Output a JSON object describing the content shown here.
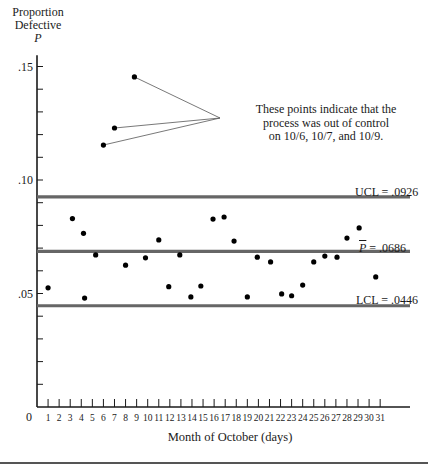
{
  "chart_data": {
    "type": "scatter",
    "title": "",
    "ylabel_lines": [
      "Proportion",
      "Defective"
    ],
    "ylabel_symbol": "P",
    "xlabel": "Month of October (days)",
    "ylim": [
      0,
      0.16
    ],
    "xlim": [
      0,
      33
    ],
    "y_ticks": [
      {
        "value": 0.15,
        "label": ".15"
      },
      {
        "value": 0.1,
        "label": ".10"
      },
      {
        "value": 0.05,
        "label": ".05"
      }
    ],
    "y_minor_step": 0.01,
    "x_origin_label": "0",
    "x_ticks": [
      1,
      2,
      3,
      4,
      5,
      6,
      7,
      8,
      9,
      10,
      11,
      12,
      13,
      14,
      15,
      16,
      17,
      18,
      19,
      20,
      21,
      22,
      23,
      24,
      25,
      26,
      27,
      28,
      29,
      30,
      31
    ],
    "grid": false,
    "control_lines": [
      {
        "name": "UCL",
        "label": "UCL = .0926",
        "value": 0.0926
      },
      {
        "name": "Pbar",
        "label_symbol": "P",
        "label_rest": " = .0686",
        "value": 0.0686
      },
      {
        "name": "LCL",
        "label": "LCL = .0446",
        "value": 0.0446
      }
    ],
    "points": [
      {
        "x": 1.0,
        "y": 0.0525
      },
      {
        "x": 3.2,
        "y": 0.083
      },
      {
        "x": 4.2,
        "y": 0.0765
      },
      {
        "x": 4.3,
        "y": 0.048
      },
      {
        "x": 5.3,
        "y": 0.067
      },
      {
        "x": 6.0,
        "y": 0.1154
      },
      {
        "x": 7.0,
        "y": 0.1229
      },
      {
        "x": 8.0,
        "y": 0.0625
      },
      {
        "x": 8.8,
        "y": 0.1454
      },
      {
        "x": 9.8,
        "y": 0.0657
      },
      {
        "x": 11.0,
        "y": 0.0736
      },
      {
        "x": 11.9,
        "y": 0.053
      },
      {
        "x": 12.9,
        "y": 0.067
      },
      {
        "x": 13.9,
        "y": 0.0485
      },
      {
        "x": 14.8,
        "y": 0.0533
      },
      {
        "x": 15.9,
        "y": 0.0828
      },
      {
        "x": 16.9,
        "y": 0.0837
      },
      {
        "x": 17.8,
        "y": 0.0731
      },
      {
        "x": 19.0,
        "y": 0.0485
      },
      {
        "x": 19.9,
        "y": 0.066
      },
      {
        "x": 21.1,
        "y": 0.0639
      },
      {
        "x": 22.1,
        "y": 0.0498
      },
      {
        "x": 23.0,
        "y": 0.049
      },
      {
        "x": 24.0,
        "y": 0.0537
      },
      {
        "x": 25.0,
        "y": 0.0639
      },
      {
        "x": 26.0,
        "y": 0.0665
      },
      {
        "x": 27.1,
        "y": 0.066
      },
      {
        "x": 28.0,
        "y": 0.0744
      },
      {
        "x": 29.1,
        "y": 0.0789
      },
      {
        "x": 30.6,
        "y": 0.0573
      }
    ],
    "annotation": {
      "lines": [
        "These points indicate that the",
        "process was out of control",
        "on 10/6, 10/7, and 10/9."
      ],
      "targets": [
        {
          "x": 6.0,
          "y": 0.1154
        },
        {
          "x": 7.0,
          "y": 0.1229
        },
        {
          "x": 8.8,
          "y": 0.1454
        }
      ],
      "anchor_px": [
        220,
        118
      ]
    },
    "colors": {
      "axis": "#1a1a1a",
      "control_line": "#666666",
      "point": "#000000",
      "leader": "#555555"
    }
  }
}
